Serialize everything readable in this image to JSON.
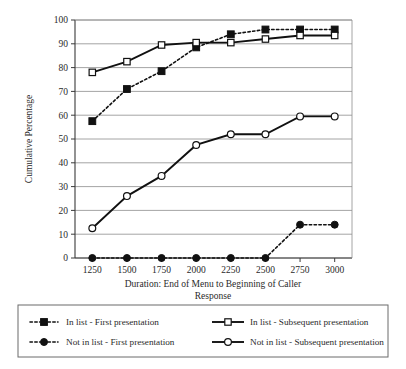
{
  "chart_data": {
    "type": "line",
    "title": "",
    "xlabel": "Duration: End of Menu to Beginning of Caller Response",
    "ylabel": "Cumulative Percentage",
    "categories": [
      1250,
      1500,
      1750,
      2000,
      2250,
      2500,
      2750,
      3000
    ],
    "x_tick_labels": [
      "1250",
      "1500",
      "1750",
      "2000",
      "2250",
      "2500",
      "2750",
      "3000"
    ],
    "y_tick_labels": [
      "0",
      "10",
      "20",
      "30",
      "40",
      "50",
      "60",
      "70",
      "80",
      "90",
      "100"
    ],
    "y_ticks": [
      0,
      10,
      20,
      30,
      40,
      50,
      60,
      70,
      80,
      90,
      100
    ],
    "ylim": [
      0,
      100
    ],
    "grid": "horizontal",
    "legend_position": "below-outside",
    "series": [
      {
        "name": "In list - First presentation",
        "line": "dotted",
        "marker": "square-filled",
        "color": "#111111",
        "values": [
          57.5,
          71.0,
          78.5,
          88.5,
          94.0,
          96.0,
          96.0,
          96.0
        ]
      },
      {
        "name": "In list - Subsequent presentation",
        "line": "solid",
        "marker": "square-open",
        "color": "#111111",
        "values": [
          78.0,
          82.5,
          89.5,
          90.5,
          90.5,
          92.0,
          93.5,
          93.5
        ]
      },
      {
        "name": "Not in list - First presentation",
        "line": "dotted",
        "marker": "circle-filled",
        "color": "#111111",
        "values": [
          0,
          0,
          0,
          0,
          0,
          0,
          14.0,
          14.0
        ]
      },
      {
        "name": "Not in list - Subsequent presentation",
        "line": "solid",
        "marker": "circle-open",
        "color": "#111111",
        "values": [
          12.5,
          26.0,
          34.5,
          47.5,
          52.0,
          52.0,
          59.5,
          59.5
        ]
      }
    ]
  },
  "axis": {
    "xlabel_line1": "Duration: End of Menu to Beginning of Caller",
    "xlabel_line2": "Response",
    "ylabel": "Cumulative Percentage"
  },
  "legend": {
    "entries": [
      {
        "label": "In list - First presentation",
        "line": "dotted",
        "marker": "square-filled"
      },
      {
        "label": "In list - Subsequent presentation",
        "line": "solid",
        "marker": "square-open"
      },
      {
        "label": "Not in list - First presentation",
        "line": "dotted",
        "marker": "circle-filled"
      },
      {
        "label": "Not in list - Subsequent presentation",
        "line": "solid",
        "marker": "circle-open"
      }
    ]
  }
}
